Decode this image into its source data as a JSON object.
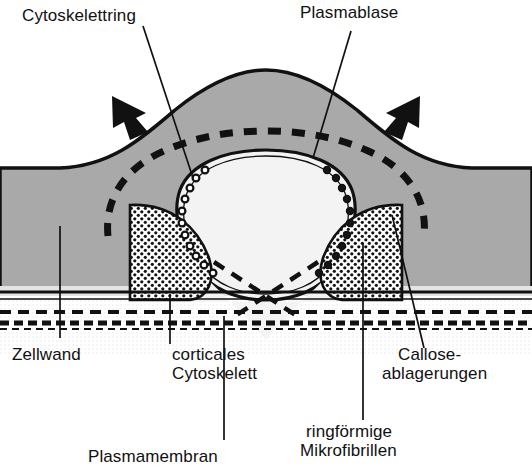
{
  "figure": {
    "kind": "biology-cross-section-diagram",
    "language": "de",
    "background_color": "#ffffff",
    "ink_color": "#111111",
    "cell_wall_fill": "#a8a8a8",
    "cytoplasm_fill": "#e8e8e8",
    "bleb_fill": "#f2f2f2",
    "callose_fill": "#ffffff"
  },
  "labels": {
    "cytoskeleton_ring": "Cytoskelettring",
    "plasma_bleb": "Plasmablase",
    "cell_wall": "Zellwand",
    "cortical_cytoskeleton_line1": "corticales",
    "cortical_cytoskeleton_line2": "Cytoskelett",
    "callose_line1": "Callose-",
    "callose_line2": "ablagerungen",
    "plasma_membrane": "Plasmamembran",
    "microfibrils_line1": "ringförmige",
    "microfibrils_line2": "Mikrofibrillen"
  },
  "annotations": {
    "arrow_left": "compression-arrow-left",
    "arrow_right": "compression-arrow-right",
    "arrow_count": 2,
    "arrow_direction": "inward"
  },
  "elements": [
    {
      "name": "cytoskeleton-ring",
      "style": "thick dashed arc"
    },
    {
      "name": "plasma-bleb",
      "style": "light dome cavity"
    },
    {
      "name": "callose-deposits",
      "style": "dense stipple wedges"
    },
    {
      "name": "ring-microfibrils",
      "style": "small open circles along bleb edge"
    },
    {
      "name": "plasma-membrane",
      "style": "dashed horizontal double line"
    },
    {
      "name": "cell-wall",
      "style": "solid grey band"
    },
    {
      "name": "cortical-cytoskeleton",
      "style": "dashed crossing lines"
    }
  ]
}
